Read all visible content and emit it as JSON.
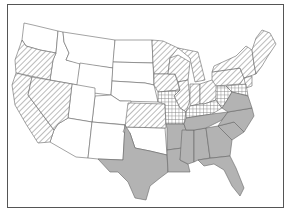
{
  "map": {
    "type": "choropleth",
    "region": "Contiguous United States",
    "legend_categories": [
      {
        "id": "none",
        "fill": "#ffffff",
        "pattern": "none"
      },
      {
        "id": "hatch",
        "fill": "#ffffff",
        "pattern": "diagonal-hatch"
      },
      {
        "id": "cross",
        "fill": "#ffffff",
        "pattern": "crosshatch"
      },
      {
        "id": "solid",
        "fill": "#b3b3b3",
        "pattern": "solid-gray"
      }
    ],
    "states": {
      "none": [
        "WA",
        "ID",
        "MT",
        "WY",
        "ND",
        "SD",
        "NE",
        "CO",
        "UT",
        "AZ",
        "NM",
        "OK"
      ],
      "hatch": [
        "OR",
        "CA",
        "NV",
        "KS",
        "MN",
        "WI",
        "IA",
        "MI",
        "IL",
        "IN",
        "OH",
        "PA",
        "NY",
        "NJ",
        "CT",
        "RI",
        "MA",
        "VT",
        "NH",
        "ME"
      ],
      "cross": [
        "MO",
        "KY",
        "WV",
        "MD",
        "DE"
      ],
      "solid": [
        "TX",
        "AR",
        "LA",
        "MS",
        "AL",
        "TN",
        "GA",
        "FL",
        "SC",
        "NC",
        "VA"
      ]
    }
  }
}
